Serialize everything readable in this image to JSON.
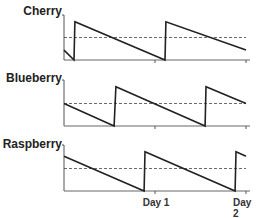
{
  "chart_data": {
    "type": "line",
    "title": "",
    "layout": "3 stacked panels sharing x-axis",
    "x_ticks": [
      {
        "label": "",
        "pos": 0.5
      },
      {
        "label": "Day 1",
        "pos": 1.0
      },
      {
        "label": "Day 2",
        "pos": 2.0
      }
    ],
    "xlim": [
      0,
      2
    ],
    "ylim": [
      0,
      1
    ],
    "grid": false,
    "series": [
      {
        "name": "Cherry",
        "points": [
          [
            0,
            0.22
          ],
          [
            0.11,
            0
          ],
          [
            0.12,
            0.85
          ],
          [
            1.11,
            0
          ],
          [
            1.12,
            0.85
          ],
          [
            2.0,
            0.22
          ]
        ],
        "threshold": 0.5
      },
      {
        "name": "Blueberry",
        "points": [
          [
            0,
            0.5
          ],
          [
            0.55,
            0
          ],
          [
            0.57,
            0.87
          ],
          [
            1.55,
            0
          ],
          [
            1.56,
            0.87
          ],
          [
            2.0,
            0.5
          ]
        ],
        "threshold": 0.5
      },
      {
        "name": "Raspberry",
        "points": [
          [
            0,
            0.77
          ],
          [
            0.88,
            0
          ],
          [
            0.89,
            0.87
          ],
          [
            1.88,
            0
          ],
          [
            1.89,
            0.87
          ],
          [
            2.0,
            0.77
          ]
        ],
        "threshold": 0.5
      }
    ]
  },
  "labels": {
    "cherry": "Cherry",
    "blueberry": "Blueberry",
    "raspberry": "Raspberry",
    "day1": "Day 1",
    "day2": "Day 2"
  }
}
